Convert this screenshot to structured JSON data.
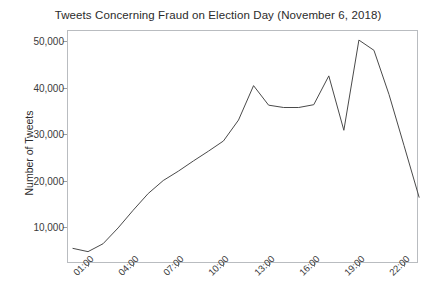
{
  "chart_data": {
    "type": "line",
    "title": "Tweets Concerning Fraud on Election Day (November 6, 2018)",
    "xlabel": "",
    "ylabel": "Number of Tweets",
    "grid": false,
    "legend": false,
    "xlim": [
      "00:00",
      "23:00"
    ],
    "ylim": [
      0,
      52000
    ],
    "yticks": [
      10000,
      20000,
      30000,
      40000,
      50000
    ],
    "ytick_labels": [
      "10,000",
      "20,000",
      "30,000",
      "40,000",
      "50,000"
    ],
    "xticks": [
      "01:00",
      "04:00",
      "07:00",
      "10:00",
      "13:00",
      "16:00",
      "19:00",
      "22:00"
    ],
    "x": [
      "00:00",
      "01:00",
      "02:00",
      "03:00",
      "04:00",
      "05:00",
      "06:00",
      "07:00",
      "08:00",
      "09:00",
      "10:00",
      "11:00",
      "12:00",
      "13:00",
      "14:00",
      "15:00",
      "16:00",
      "17:00",
      "18:00",
      "19:00",
      "20:00",
      "21:00",
      "22:00",
      "23:00"
    ],
    "values": [
      5400,
      4700,
      6400,
      9800,
      13600,
      17200,
      20000,
      22000,
      24200,
      26300,
      28500,
      33000,
      40400,
      36200,
      35700,
      35700,
      36300,
      42500,
      30800,
      50200,
      48000,
      38500,
      27500,
      16400
    ],
    "series": [
      {
        "name": "Number of Tweets",
        "color": "#4a4a4a",
        "values": [
          5400,
          4700,
          6400,
          9800,
          13600,
          17200,
          20000,
          22000,
          24200,
          26300,
          28500,
          33000,
          40400,
          36200,
          35700,
          35700,
          36300,
          42500,
          30800,
          50200,
          48000,
          38500,
          27500,
          16400
        ]
      }
    ]
  },
  "axis_colors": {
    "frame": "#b9bcc0",
    "tick": "#9a9da1",
    "text": "#2b2b2b"
  }
}
